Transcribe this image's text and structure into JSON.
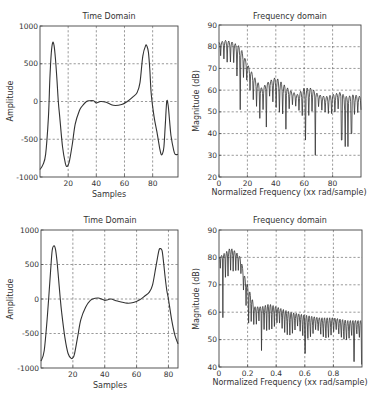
{
  "chart_data": [
    {
      "id": "top-left",
      "type": "line",
      "title": "Time Domain",
      "xlabel": "Samples",
      "ylabel": "Amplitude",
      "xlim": [
        0,
        98
      ],
      "ylim": [
        -1000,
        1000
      ],
      "xticks": [
        20,
        40,
        60,
        80
      ],
      "yticks": [
        -1000,
        -500,
        0,
        500,
        1000
      ],
      "xtick_labels": [
        "20",
        "40",
        "60",
        "80"
      ],
      "ytick_labels": [
        "-1000",
        "-500",
        "0",
        "500",
        "1000"
      ],
      "grid": true,
      "series": [
        {
          "name": "signal",
          "x": [
            0,
            2,
            4,
            6,
            7,
            8,
            9,
            10,
            11,
            12,
            13,
            14,
            16,
            18,
            19,
            20,
            21,
            23,
            25,
            28,
            30,
            33,
            35,
            38,
            40,
            43,
            47,
            52,
            58,
            62,
            66,
            69,
            71,
            73,
            75,
            76,
            77,
            78,
            79,
            81,
            83,
            85,
            86,
            87,
            88,
            89,
            90,
            91,
            92,
            93,
            95,
            96,
            98
          ],
          "y": [
            -900,
            -840,
            -700,
            -200,
            300,
            640,
            780,
            740,
            560,
            300,
            0,
            -200,
            -600,
            -820,
            -860,
            -840,
            -780,
            -560,
            -300,
            -120,
            -60,
            0,
            10,
            10,
            -20,
            0,
            -10,
            -50,
            -40,
            0,
            60,
            120,
            250,
            600,
            740,
            730,
            650,
            420,
            100,
            -200,
            -400,
            -620,
            -700,
            -690,
            -600,
            -300,
            0,
            -50,
            -250,
            -450,
            -650,
            -700,
            -700
          ]
        }
      ]
    },
    {
      "id": "top-right",
      "type": "line",
      "title": "Frequency domain",
      "xlabel": "Normalized Frequency (xx rad/sample)",
      "ylabel": "Magnitude (dB)",
      "xlim": [
        0,
        100
      ],
      "ylim": [
        20,
        90
      ],
      "xticks": [
        0,
        20,
        40,
        60,
        80
      ],
      "yticks": [
        20,
        30,
        40,
        50,
        60,
        70,
        80,
        90
      ],
      "xtick_labels": [
        "0",
        "20",
        "40",
        "60",
        "80"
      ],
      "ytick_labels": [
        "20",
        "30",
        "40",
        "50",
        "60",
        "70",
        "80",
        "90"
      ],
      "grid": true,
      "series": [
        {
          "name": "magnitude",
          "description": "oscillating spectrum; upper envelope and null depths",
          "envelope_x": [
            0,
            5,
            10,
            15,
            20,
            25,
            30,
            35,
            40,
            45,
            50,
            55,
            60,
            65,
            70,
            75,
            80,
            85,
            90,
            95,
            100
          ],
          "upper_envelope": [
            82,
            83,
            82,
            80,
            72,
            66,
            61,
            64,
            66,
            63,
            60,
            58,
            61,
            61,
            58,
            57,
            58,
            59,
            57,
            58,
            57
          ],
          "lower_envelope": [
            72,
            71,
            74,
            55,
            58,
            52,
            47,
            48,
            46,
            45,
            46,
            48,
            42,
            44,
            45,
            47,
            46,
            45,
            42,
            45,
            47
          ],
          "deep_nulls": [
            [
              15,
              51
            ],
            [
              28,
              47
            ],
            [
              34,
              43
            ],
            [
              46,
              42
            ],
            [
              60,
              37
            ],
            [
              68,
              30
            ],
            [
              87,
              37
            ],
            [
              90,
              34
            ],
            [
              93,
              40
            ]
          ],
          "oscillation_period": 2.3
        }
      ]
    },
    {
      "id": "bottom-left",
      "type": "line",
      "title": "Time Domain",
      "xlabel": "Samples",
      "ylabel": "Amplitude",
      "xlim": [
        0,
        86
      ],
      "ylim": [
        -1000,
        1000
      ],
      "xticks": [
        20,
        40,
        60,
        80
      ],
      "yticks": [
        -1000,
        -500,
        0,
        500,
        1000
      ],
      "xtick_labels": [
        "20",
        "40",
        "60",
        "80"
      ],
      "ytick_labels": [
        "-1000",
        "-500",
        "0",
        "500",
        "1000"
      ],
      "grid": true,
      "series": [
        {
          "name": "signal",
          "x": [
            0,
            2,
            4,
            6,
            7,
            8,
            9,
            10,
            11,
            12,
            13,
            15,
            17,
            19,
            20,
            21,
            23,
            25,
            28,
            31,
            34,
            36,
            38,
            40,
            42,
            44,
            48,
            54,
            58,
            62,
            65,
            68,
            70,
            72,
            74,
            75,
            76,
            77,
            78,
            79,
            80,
            82,
            84,
            86
          ],
          "y": [
            -900,
            -750,
            -250,
            400,
            700,
            770,
            730,
            560,
            300,
            30,
            -200,
            -560,
            -790,
            -860,
            -850,
            -800,
            -550,
            -300,
            -120,
            -20,
            10,
            15,
            0,
            -20,
            -10,
            0,
            -30,
            -60,
            -50,
            -10,
            40,
            100,
            200,
            450,
            700,
            730,
            700,
            520,
            300,
            120,
            0,
            -300,
            -520,
            -650
          ]
        }
      ]
    },
    {
      "id": "bottom-right",
      "type": "line",
      "title": "Frequency domain",
      "xlabel": "Normalized Frequency (xx rad/sample)",
      "ylabel": "Magnitude (dB)",
      "xlim": [
        0,
        1
      ],
      "ylim": [
        40,
        90
      ],
      "xticks": [
        0,
        0.2,
        0.4,
        0.6,
        0.8
      ],
      "yticks": [
        40,
        50,
        60,
        70,
        80,
        90
      ],
      "xtick_labels": [
        "0",
        "0.2",
        "0.4",
        "0.6",
        "0.8"
      ],
      "ytick_labels": [
        "40",
        "50",
        "60",
        "70",
        "80",
        "90"
      ],
      "grid": true,
      "series": [
        {
          "name": "magnitude",
          "description": "oscillating spectrum; upper envelope and null depths",
          "envelope_x": [
            0,
            0.05,
            0.08,
            0.12,
            0.15,
            0.18,
            0.2,
            0.25,
            0.3,
            0.35,
            0.4,
            0.5,
            0.6,
            0.7,
            0.8,
            0.9,
            1.0
          ],
          "upper_envelope": [
            80,
            82,
            83.5,
            82,
            80,
            73,
            70,
            62,
            62,
            63,
            62,
            60,
            59,
            58,
            58,
            57,
            57
          ],
          "lower_envelope": [
            76,
            70,
            75,
            73,
            70,
            62,
            56,
            52,
            48,
            50,
            49,
            47,
            45,
            46,
            45,
            44,
            43
          ],
          "deep_nulls": [
            [
              0.02,
              69
            ],
            [
              0.03,
              58
            ],
            [
              0.2,
              56
            ],
            [
              0.29,
              46
            ],
            [
              0.6,
              45
            ],
            [
              0.95,
              42
            ],
            [
              1.0,
              41
            ]
          ],
          "oscillation_period": 0.018
        }
      ]
    }
  ]
}
